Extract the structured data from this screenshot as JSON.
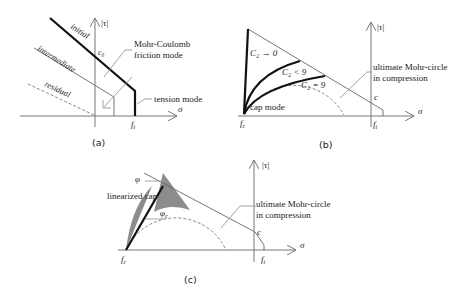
{
  "figure": {
    "panels": [
      {
        "id": "a",
        "caption": "(a)",
        "axis_x_label": "σ",
        "axis_y_label": "|τ|",
        "labels": {
          "c0": "c₀",
          "ft": "f",
          "ft_sub": "t",
          "initial": "initial",
          "intermediate": "intermediate",
          "residual": "residual",
          "mohr_coulomb_line1": "Mohr-Coulomb",
          "mohr_coulomb_line2": "friction mode",
          "tension_mode": "tension mode"
        }
      },
      {
        "id": "b",
        "caption": "(b)",
        "axis_x_label": "σ",
        "axis_y_label": "|τ|",
        "labels": {
          "c": "c",
          "fc": "f",
          "fc_sub": "c",
          "ft": "f",
          "ft_sub": "t",
          "c2_to_0": "C₂ → 0",
          "c2_lt_9": "C₂ < 9",
          "c2_eq_9": "C₂ = 9",
          "cap_mode": "cap mode",
          "mohr_circle_line1": "ultimate Mohr-circle",
          "mohr_circle_line2": "in compression"
        }
      },
      {
        "id": "c",
        "caption": "(c)",
        "axis_x_label": "σ",
        "axis_y_label": "|τ|",
        "labels": {
          "phi": "φ",
          "phi_c": "φ",
          "phi_c_sub": "c",
          "linearized_cap": "linearized cap",
          "c": "c",
          "fc": "f",
          "fc_sub": "c",
          "ft": "f",
          "ft_sub": "t",
          "mohr_circle_line1": "ultimate Mohr-circle",
          "mohr_circle_line2": "in compression"
        }
      }
    ]
  }
}
